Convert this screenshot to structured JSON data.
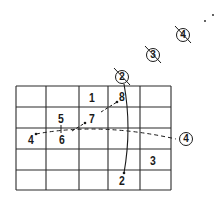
{
  "diagram": {
    "grid": {
      "columns": 5,
      "rows": 5,
      "x_lines": [
        16,
        46,
        79,
        108,
        140,
        171
      ],
      "y_lines": [
        86,
        107,
        128,
        149,
        170,
        190
      ],
      "stroke_color": "#2a2a2a"
    },
    "cell_labels": [
      {
        "text": "1",
        "x": 92,
        "y": 97
      },
      {
        "text": "8",
        "x": 122,
        "y": 96
      },
      {
        "text": "5",
        "x": 61,
        "y": 118
      },
      {
        "text": "7",
        "x": 92,
        "y": 118
      },
      {
        "text": "4",
        "x": 31,
        "y": 139
      },
      {
        "text": "6",
        "x": 62,
        "y": 139
      },
      {
        "text": "3",
        "x": 153,
        "y": 160
      },
      {
        "text": "2",
        "x": 122,
        "y": 180
      }
    ],
    "circled_labels": [
      {
        "text": "2",
        "x": 122,
        "y": 77,
        "struck": true
      },
      {
        "text": "3",
        "x": 153,
        "y": 55,
        "struck": true
      },
      {
        "text": "4",
        "x": 183,
        "y": 35,
        "struck": true
      },
      {
        "text": "4",
        "x": 186,
        "y": 139,
        "struck": false
      }
    ],
    "stray_dots": [
      {
        "x": 205,
        "y": 21
      },
      {
        "x": 213,
        "y": 15
      }
    ],
    "ink_color": "#1a1a1a"
  }
}
